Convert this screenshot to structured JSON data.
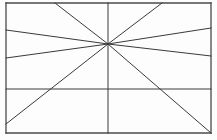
{
  "canvas": {
    "width": 217,
    "height": 140,
    "background_color": "#fdfdfd",
    "title": "Perspective vanishing point line diagram"
  },
  "style": {
    "line_color": "#3a3a3a",
    "frame_color": "#4a4a4a",
    "line_width": 1,
    "frame_width": 1.3
  },
  "chart_data": {
    "type": "line",
    "xlabel": "",
    "ylabel": "",
    "xlim": [
      0,
      217
    ],
    "ylim": [
      0,
      140
    ],
    "grid": false,
    "legend": "none",
    "vanishing_point": {
      "x": 108,
      "y": 44
    },
    "frame": {
      "x1": 6,
      "y1": 3,
      "x2": 211,
      "y2": 133
    },
    "series": [
      {
        "name": "frame-top",
        "kind": "frame-edge",
        "points": [
          [
            6,
            3
          ],
          [
            211,
            3
          ]
        ]
      },
      {
        "name": "frame-right",
        "kind": "frame-edge",
        "points": [
          [
            211,
            3
          ],
          [
            211,
            133
          ]
        ]
      },
      {
        "name": "frame-bottom",
        "kind": "frame-edge",
        "points": [
          [
            211,
            133
          ],
          [
            6,
            133
          ]
        ]
      },
      {
        "name": "frame-left",
        "kind": "frame-edge",
        "points": [
          [
            6,
            133
          ],
          [
            6,
            3
          ]
        ]
      },
      {
        "name": "vertical-axis",
        "kind": "structural",
        "points": [
          [
            108,
            3
          ],
          [
            108,
            133
          ]
        ]
      },
      {
        "name": "horizontal-divider",
        "kind": "structural",
        "points": [
          [
            6,
            89
          ],
          [
            211,
            89
          ]
        ]
      },
      {
        "name": "ray-upper-left-converging",
        "kind": "perspective-ray",
        "points": [
          [
            6,
            30
          ],
          [
            108,
            44
          ]
        ]
      },
      {
        "name": "ray-upper-right-converging",
        "kind": "perspective-ray",
        "points": [
          [
            211,
            28
          ],
          [
            108,
            44
          ]
        ]
      },
      {
        "name": "ray-lower-left-converging",
        "kind": "perspective-ray",
        "points": [
          [
            6,
            58
          ],
          [
            108,
            44
          ]
        ]
      },
      {
        "name": "ray-lower-right-converging",
        "kind": "perspective-ray",
        "points": [
          [
            211,
            56
          ],
          [
            108,
            44
          ]
        ]
      },
      {
        "name": "diagonal-top-left-to-point",
        "kind": "perspective-ray",
        "points": [
          [
            55,
            3
          ],
          [
            108,
            44
          ]
        ]
      },
      {
        "name": "diagonal-top-right-to-point",
        "kind": "perspective-ray",
        "points": [
          [
            162,
            3
          ],
          [
            108,
            44
          ]
        ]
      },
      {
        "name": "diagonal-bottom-left-to-point",
        "kind": "perspective-ray",
        "points": [
          [
            6,
            124
          ],
          [
            108,
            44
          ]
        ]
      },
      {
        "name": "diagonal-bottom-right-to-point",
        "kind": "perspective-ray",
        "points": [
          [
            211,
            133
          ],
          [
            108,
            44
          ]
        ]
      }
    ]
  }
}
